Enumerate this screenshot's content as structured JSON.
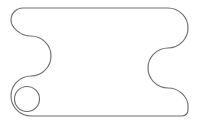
{
  "document": {
    "kind": "technical-line-drawing",
    "title": "Part Outline",
    "background_color": "#ffffff",
    "canvas": {
      "width": 199,
      "height": 128
    }
  },
  "drawing": {
    "stroke_color": "#6e6e6e",
    "fill_color": "#ffffff",
    "stroke_width": 1.15,
    "shapes": [
      {
        "name": "part-outline",
        "type": "closed-path",
        "description": "Rounded rectangular plate with symmetric concave side notches",
        "bounds": {
          "left": 11,
          "top": 8,
          "right": 188,
          "bottom": 116
        },
        "path": "M 31 8 L 168 8 C 179 8 188 17 188 28 C 188 39 179 48 168 48 C 157 48 148 57 148 68 C 148 79 157 88 168 88 C 179 88 188 97 188 106 L 188 110 C 188 113.3 185.3 116 182 116 L 31 116 C 20 116 11 107 11 96 C 11 85 20 76 31 76 C 42 76 51 67 51 56 C 51 45 42 36 31 36 C 20 36 11 27 11 20 C 11 13.4 16.4 8 23 8 Z",
        "corners": [
          {
            "name": "top-left-corner",
            "radius": 20
          },
          {
            "name": "top-right-corner",
            "radius": 20
          },
          {
            "name": "bottom-right-corner",
            "radius": 20
          },
          {
            "name": "bottom-left-corner",
            "radius": 20
          }
        ],
        "notches": [
          {
            "name": "left-side-notch",
            "center_x": 51,
            "center_y": 56,
            "radius": 20,
            "concave": true
          },
          {
            "name": "right-side-notch",
            "center_x": 148,
            "center_y": 68,
            "radius": 20,
            "concave": true
          }
        ]
      },
      {
        "name": "mounting-hole",
        "type": "circle",
        "description": "Small circular through-hole near bottom-left corner",
        "center_x": 27,
        "center_y": 99,
        "radius": 12.5
      }
    ]
  }
}
